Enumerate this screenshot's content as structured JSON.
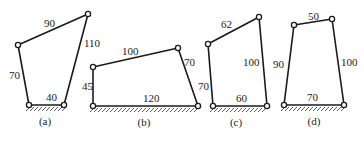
{
  "figures": [
    {
      "id": "a",
      "caption": "(a)",
      "joints": {
        "A": [
          29,
          105
        ],
        "B": [
          18,
          45
        ],
        "C": [
          88,
          14
        ],
        "D": [
          64,
          105
        ]
      },
      "links": [
        {
          "name": "frame",
          "from": "A",
          "to": "D",
          "length": "40",
          "label_pos": [
            46,
            101
          ]
        },
        {
          "name": "left",
          "from": "A",
          "to": "B",
          "length": "70",
          "label_pos": [
            9,
            79
          ]
        },
        {
          "name": "top",
          "from": "B",
          "to": "C",
          "length": "90",
          "label_pos": [
            44,
            27
          ]
        },
        {
          "name": "right",
          "from": "C",
          "to": "D",
          "length": "110",
          "label_pos": [
            84,
            47
          ]
        }
      ],
      "caption_pos": [
        45,
        125
      ]
    },
    {
      "id": "b",
      "caption": "(b)",
      "joints": {
        "A": [
          93,
          106
        ],
        "B": [
          93,
          67
        ],
        "C": [
          178,
          48
        ],
        "D": [
          198,
          106
        ]
      },
      "links": [
        {
          "name": "frame",
          "from": "A",
          "to": "D",
          "length": "120",
          "label_pos": [
            143,
            102
          ]
        },
        {
          "name": "left",
          "from": "A",
          "to": "B",
          "length": "45",
          "label_pos": [
            82,
            90
          ]
        },
        {
          "name": "top",
          "from": "B",
          "to": "C",
          "length": "100",
          "label_pos": [
            122,
            55
          ]
        },
        {
          "name": "right",
          "from": "C",
          "to": "D",
          "length": "70",
          "label_pos": [
            184,
            66
          ]
        }
      ],
      "caption_pos": [
        144,
        126
      ]
    },
    {
      "id": "c",
      "caption": "(c)",
      "joints": {
        "A": [
          213,
          106
        ],
        "B": [
          208,
          44
        ],
        "C": [
          259,
          17
        ],
        "D": [
          267,
          106
        ]
      },
      "links": [
        {
          "name": "frame",
          "from": "A",
          "to": "D",
          "length": "60",
          "label_pos": [
            236,
            102
          ]
        },
        {
          "name": "left",
          "from": "A",
          "to": "B",
          "length": "70",
          "label_pos": [
            198,
            90
          ]
        },
        {
          "name": "top",
          "from": "B",
          "to": "C",
          "length": "62",
          "label_pos": [
            221,
            28
          ]
        },
        {
          "name": "right",
          "from": "C",
          "to": "D",
          "length": "100",
          "label_pos": [
            243,
            66
          ]
        }
      ],
      "caption_pos": [
        236,
        126
      ]
    },
    {
      "id": "d",
      "caption": "(d)",
      "joints": {
        "A": [
          284,
          105
        ],
        "B": [
          294,
          25
        ],
        "C": [
          332,
          19
        ],
        "D": [
          344,
          105
        ]
      },
      "links": [
        {
          "name": "frame",
          "from": "A",
          "to": "D",
          "length": "70",
          "label_pos": [
            307,
            101
          ]
        },
        {
          "name": "left",
          "from": "A",
          "to": "B",
          "length": "90",
          "label_pos": [
            273,
            68
          ]
        },
        {
          "name": "top",
          "from": "B",
          "to": "C",
          "length": "50",
          "label_pos": [
            308,
            20
          ]
        },
        {
          "name": "right",
          "from": "C",
          "to": "D",
          "length": "100",
          "label_pos": [
            341,
            66
          ]
        }
      ],
      "caption_pos": [
        314,
        125
      ]
    }
  ]
}
